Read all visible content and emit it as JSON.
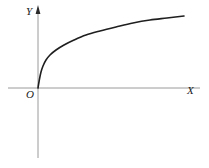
{
  "figure": {
    "width": 209,
    "height": 168,
    "background": "#ffffff"
  },
  "labels": {
    "y_axis": "Y",
    "x_axis": "X",
    "origin": "O"
  },
  "colors": {
    "axis": "#9a9a9a",
    "curve": "#1f1f1f",
    "label": "#1a1a1a",
    "arrow": "#2b2b2b"
  },
  "chart_data": {
    "type": "line",
    "title": "",
    "xlabel": "X",
    "ylabel": "Y",
    "legend": [],
    "grid": false,
    "annotations": [
      "O"
    ],
    "axes": {
      "origin_px": [
        38,
        88
      ],
      "x_axis_px": {
        "x1": 8,
        "x2": 200,
        "y": 88,
        "arrow": false
      },
      "y_axis_px": {
        "y1": 10,
        "y2": 158,
        "x": 38,
        "arrow": true
      }
    },
    "xlim": [
      0,
      8
    ],
    "ylim": [
      0,
      3.1
    ],
    "x": [
      0.0,
      0.12,
      0.3,
      0.6,
      1.0,
      1.6,
      2.3,
      3.2,
      4.2,
      5.3,
      6.4,
      7.6
    ],
    "y": [
      0.0,
      0.62,
      0.97,
      1.3,
      1.56,
      1.84,
      2.07,
      2.29,
      2.47,
      2.63,
      2.76,
      2.88
    ],
    "curve_points_px": [
      [
        38,
        88
      ],
      [
        39.5,
        79
      ],
      [
        41,
        72
      ],
      [
        43,
        66
      ],
      [
        46,
        60
      ],
      [
        50,
        55
      ],
      [
        56,
        50
      ],
      [
        64,
        45
      ],
      [
        74,
        40
      ],
      [
        86,
        35
      ],
      [
        100,
        31
      ],
      [
        116,
        27
      ],
      [
        133,
        23
      ],
      [
        150,
        20
      ],
      [
        167,
        18
      ],
      [
        184,
        16
      ]
    ]
  }
}
